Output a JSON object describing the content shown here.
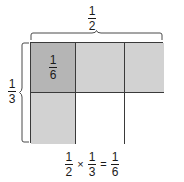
{
  "diagram": {
    "kind": "fraction-area-model",
    "colors": {
      "shaded_dark": "#b5b5b5",
      "shaded_light": "#d2d2d2",
      "unshaded": "#ffffff",
      "stroke": "#3a3a3a",
      "text": "#1a1a1a",
      "background": "#ffffff"
    },
    "top_label": {
      "numerator": "1",
      "denominator": "2"
    },
    "left_label": {
      "numerator": "1",
      "denominator": "3"
    },
    "grid": {
      "columns": 3,
      "rows": 2,
      "cells": [
        {
          "row": 0,
          "col": 0,
          "fill": "dark",
          "numerator": "1",
          "denominator": "6"
        },
        {
          "row": 0,
          "col": 1,
          "fill": "light",
          "numerator": "",
          "denominator": ""
        },
        {
          "row": 0,
          "col": 2,
          "fill": "light",
          "numerator": "",
          "denominator": ""
        },
        {
          "row": 1,
          "col": 0,
          "fill": "light",
          "numerator": "",
          "denominator": ""
        },
        {
          "row": 1,
          "col": 1,
          "fill": "none",
          "numerator": "",
          "denominator": ""
        },
        {
          "row": 1,
          "col": 2,
          "fill": "none",
          "numerator": "",
          "denominator": ""
        }
      ]
    },
    "equation": {
      "factor1": {
        "numerator": "1",
        "denominator": "2"
      },
      "times": "×",
      "factor2": {
        "numerator": "1",
        "denominator": "3"
      },
      "equals": "=",
      "product": {
        "numerator": "1",
        "denominator": "6"
      },
      "text": "1/2 × 1/3 = 1/6"
    }
  }
}
